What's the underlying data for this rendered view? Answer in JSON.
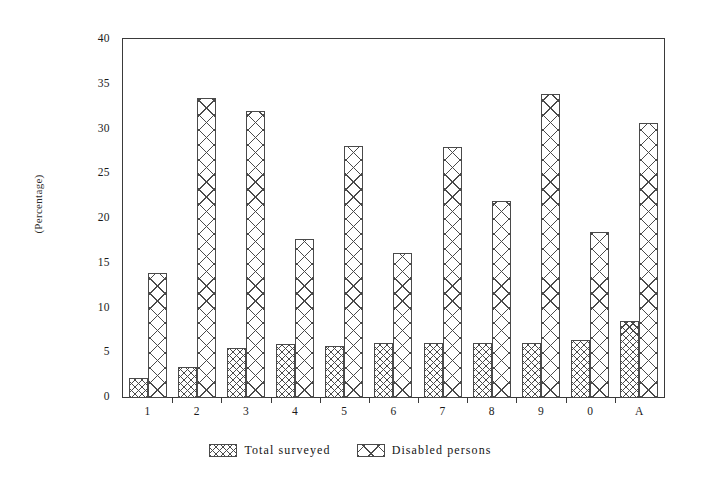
{
  "chart_data": {
    "type": "bar",
    "title": "",
    "subtitle": "",
    "xlabel": "",
    "ylabel": "(Percentage)",
    "ylim": [
      0,
      40
    ],
    "yticks": [
      0,
      5,
      10,
      15,
      20,
      25,
      30,
      35,
      40
    ],
    "ytick_labels": [
      "0",
      "5",
      "10",
      "15",
      "20",
      "25",
      "30",
      "35",
      "40"
    ],
    "grid": false,
    "legend_position": "below-center",
    "categories": [
      "1",
      "2",
      "3",
      "4",
      "5",
      "6",
      "7",
      "8",
      "9",
      "0",
      "A"
    ],
    "series": [
      {
        "name": "Total surveyed",
        "pattern": "dense-crosshatch",
        "values": [
          2.2,
          3.5,
          5.6,
          6.0,
          5.8,
          6.2,
          6.1,
          6.2,
          6.2,
          6.5,
          8.6
        ]
      },
      {
        "name": "Disabled persons",
        "pattern": "wide-crosshatch",
        "values": [
          14.0,
          33.5,
          32.1,
          17.8,
          28.2,
          16.2,
          28.1,
          22.0,
          34.0,
          18.5,
          30.7
        ]
      }
    ]
  },
  "legend": {
    "items": [
      {
        "label": "Total surveyed"
      },
      {
        "label": "Disabled persons"
      }
    ]
  },
  "colors": {
    "ink": "#3a3a3a",
    "hatch": "#4a4a4a",
    "background": "#ffffff"
  }
}
